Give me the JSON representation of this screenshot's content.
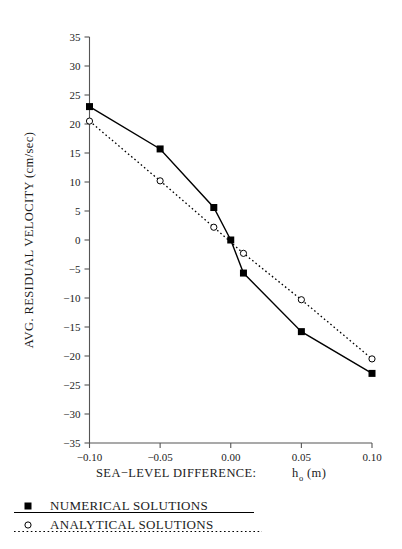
{
  "chart_data": {
    "type": "line",
    "title": "",
    "xlabel": "SEA−LEVEL DIFFERENCE:  h₀ (m)",
    "xlabel_main": "SEA−LEVEL DIFFERENCE:",
    "xlabel_symbol": "h",
    "xlabel_subscript": "o",
    "xlabel_unit": "(m)",
    "ylabel": "AVG. RESIDUAL VELOCITY (cm/sec)",
    "xlim": [
      -0.125,
      0.115
    ],
    "ylim": [
      -35,
      35
    ],
    "xticks": [
      -0.1,
      -0.05,
      0.0,
      0.05,
      0.1
    ],
    "xticklabels": [
      "-0.10",
      "-0.05",
      "0.00",
      "0.05",
      "0.10"
    ],
    "yticks": [
      35,
      30,
      25,
      20,
      15,
      10,
      5,
      0,
      -5,
      -10,
      -15,
      -20,
      -25,
      -30,
      -35
    ],
    "yticklabels": [
      "35",
      "30",
      "25",
      "20",
      "15",
      "10",
      "5",
      "0",
      "-5",
      "-10",
      "-15",
      "-20",
      "-25",
      "-30",
      "-35"
    ],
    "grid": false,
    "legend_position": "below-axes-left",
    "series": [
      {
        "name": "NUMERICAL SOLUTIONS",
        "marker": "filled-square",
        "linestyle": "solid",
        "color": "#000000",
        "x": [
          -0.1,
          -0.05,
          -0.012,
          0.0,
          0.009,
          0.05,
          0.1
        ],
        "y": [
          23.0,
          15.7,
          5.6,
          0.0,
          -5.7,
          -15.8,
          -23.0
        ]
      },
      {
        "name": "ANALYTICAL SOLUTIONS",
        "marker": "open-circle",
        "linestyle": "dotted",
        "color": "#000000",
        "x": [
          -0.1,
          -0.05,
          -0.012,
          0.009,
          0.05,
          0.1
        ],
        "y": [
          20.5,
          10.2,
          2.2,
          -2.3,
          -10.3,
          -20.5
        ]
      }
    ]
  },
  "legend": {
    "items": [
      {
        "label": "NUMERICAL SOLUTIONS",
        "marker": "filled-square",
        "linestyle": "solid"
      },
      {
        "label": "ANALYTICAL SOLUTIONS",
        "marker": "open-circle",
        "linestyle": "dotted"
      }
    ]
  },
  "colors": {
    "ink": "#1c1c1c",
    "axis": "#4a4a4a",
    "background": "#ffffff"
  }
}
